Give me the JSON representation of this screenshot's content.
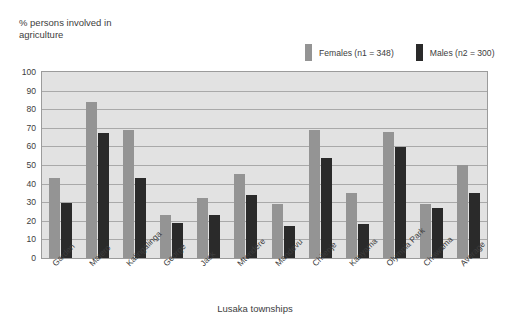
{
  "chart_data": {
    "type": "bar",
    "title": "",
    "ylabel": "% persons involved in agriculture",
    "xlabel": "Lusaka townships",
    "ylim": [
      0,
      100
    ],
    "yticks": [
      100,
      90,
      80,
      70,
      60,
      50,
      40,
      30,
      20,
      10,
      0
    ],
    "grid": true,
    "legend_position": "top-right",
    "categories": [
      "Garden",
      "Matero",
      "Kalingalinga",
      "George",
      "Jack",
      "Mtendere",
      "Mandevu",
      "Chilenje",
      "Kanyama",
      "Olympia Park",
      "Chawama",
      "Average"
    ],
    "series": [
      {
        "name": "Females (n1 = 348)",
        "color": "#949494",
        "values": [
          43,
          84,
          69,
          23,
          32,
          45,
          29,
          69,
          35,
          68,
          29,
          50
        ]
      },
      {
        "name": "Males  (n2 = 300)",
        "color": "#2a2a2a",
        "values": [
          29.5,
          67,
          43,
          19,
          23,
          34,
          17,
          54,
          18.5,
          59.5,
          27,
          35
        ]
      }
    ]
  },
  "legend": {
    "items": [
      {
        "label": "Females (n1 = 348)",
        "color": "#949494"
      },
      {
        "label": "Males  (n2 = 300)",
        "color": "#2a2a2a"
      }
    ]
  }
}
